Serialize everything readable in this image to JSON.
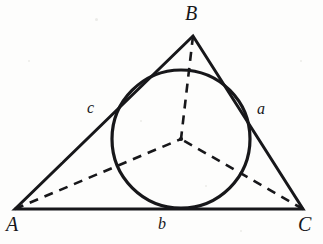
{
  "figure": {
    "kind": "geometry-diagram",
    "background_color": "#fdfdfc",
    "ink_color": "#17171a",
    "width": 323,
    "height": 244
  },
  "chart_data": {
    "type": "diagram",
    "title": "",
    "shapes": {
      "triangle": {
        "name": "triangle-ABC",
        "stroke": "#17171a",
        "stroke_width": 3,
        "vertices": [
          {
            "label": "A",
            "x": 15,
            "y": 209
          },
          {
            "label": "B",
            "x": 193,
            "y": 36
          },
          {
            "label": "C",
            "x": 303,
            "y": 209
          }
        ]
      },
      "incircle": {
        "name": "inscribed-circle",
        "cx": 181,
        "cy": 139,
        "r": 69,
        "stroke": "#17171a",
        "stroke_width": 3.2,
        "fill": "none"
      },
      "incenter": {
        "name": "incenter-point",
        "x": 181,
        "y": 139
      },
      "bisectors": [
        {
          "name": "bisector-A",
          "x1": 15,
          "y1": 209,
          "x2": 181,
          "y2": 139
        },
        {
          "name": "bisector-B",
          "x1": 193,
          "y1": 36,
          "x2": 181,
          "y2": 139
        },
        {
          "name": "bisector-C",
          "x1": 303,
          "y1": 209,
          "x2": 181,
          "y2": 139
        }
      ],
      "bisector_style": {
        "stroke": "#17171a",
        "stroke_width": 2.6,
        "dash": "9 7"
      }
    }
  },
  "labels": {
    "vertices": [
      {
        "text": "B",
        "x": 185,
        "y": 3
      },
      {
        "text": "A",
        "x": 6,
        "y": 214
      },
      {
        "text": "C",
        "x": 298,
        "y": 214
      }
    ],
    "sides": [
      {
        "text": "c",
        "x": 87,
        "y": 100
      },
      {
        "text": "a",
        "x": 257,
        "y": 101
      },
      {
        "text": "b",
        "x": 158,
        "y": 216
      }
    ]
  }
}
